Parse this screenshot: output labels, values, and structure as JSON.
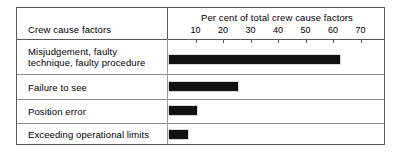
{
  "figure": {
    "header_row_label": "Crew cause factors"
  },
  "chart_data": {
    "type": "bar",
    "orientation": "horizontal",
    "title": "Per cent of total crew cause factors",
    "xlabel": "Per cent of total crew cause factors",
    "ylabel": "Crew cause factors",
    "xlim": [
      0,
      75
    ],
    "xticks": [
      10,
      20,
      30,
      40,
      50,
      60,
      70
    ],
    "xticklabels": [
      "10",
      "20",
      "30",
      "40",
      "50",
      "60",
      "70"
    ],
    "grid": false,
    "legend": null,
    "categories": [
      "Misjudgement, faulty technique, faulty procedure",
      "Failure to see",
      "Position error",
      "Exceeding operational limits"
    ],
    "values": [
      62,
      25,
      10,
      7
    ],
    "category_lines": [
      [
        "Misjudgement, faulty",
        "technique, faulty procedure"
      ],
      [
        "Failure to see"
      ],
      [
        "Position error"
      ],
      [
        "Exceeding operational limits"
      ]
    ]
  },
  "colors": {
    "bar": "#111111",
    "border": "#585858",
    "rule": "#8a8a8a",
    "background": "#ffffff"
  }
}
